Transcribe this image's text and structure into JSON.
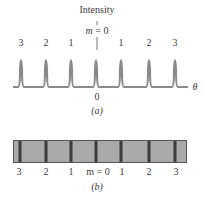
{
  "figure_a": {
    "y_label": "Intensity",
    "center_label": "m = 0",
    "center_m": "m",
    "center_eq": " = 0",
    "x_axis_label": "θ",
    "origin_label": "0",
    "caption": "(a)",
    "peak_labels": [
      "3",
      "2",
      "1",
      "",
      "1",
      "2",
      "3"
    ],
    "peak_x": [
      21,
      46,
      71,
      96,
      121,
      149,
      175
    ],
    "line_color": "#8a8a8a"
  },
  "figure_b": {
    "caption": "(b)",
    "fringe_labels": [
      "3",
      "2",
      "1",
      "m = 0",
      "1",
      "2",
      "3"
    ],
    "fringe_x": [
      20,
      46,
      71,
      96,
      121,
      149,
      175
    ],
    "bar_color": "#a9a9a9",
    "fringe_color": "#3c3c3c"
  }
}
